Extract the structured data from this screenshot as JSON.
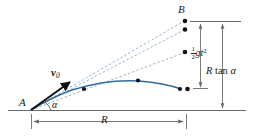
{
  "figure": {
    "type": "projectile-motion-diagram",
    "caption_labels": {
      "launch_point": "A",
      "target_point": "B",
      "initial_velocity": "v",
      "initial_velocity_subscript": "0",
      "launch_angle": "α",
      "range_label": "R",
      "drop_numerator": "1",
      "drop_denominator": "2",
      "drop_body": "gt",
      "drop_exponent": "2",
      "height_label_R": "R",
      "height_label_tan": "tan",
      "height_label_alpha": "α"
    },
    "colors": {
      "trajectory": "#2f6d9e",
      "dashed_line": "#8fa9bd",
      "axis": "#6b6b6b",
      "ink": "#1a1a1a",
      "background": "#ffffff"
    },
    "geometry": {
      "origin_A": [
        31,
        110
      ],
      "point_B": [
        185,
        21
      ],
      "ground_y": 110,
      "ground_x_start": 8,
      "ground_x_end": 246,
      "range_dim_y": 121,
      "range_x_start": 31,
      "range_x_end": 186,
      "inner_dim_x": 200,
      "outer_dim_x": 222,
      "inner_dim_top": 22,
      "inner_dim_bottom": 88,
      "outer_dim_top": 22,
      "outer_dim_bottom": 110,
      "tick_top_y": 21,
      "tick_top_x_start": 190,
      "tick_top_x_end": 241
    },
    "markers": {
      "trajectory_dots": [
        [
          84,
          89
        ],
        [
          138,
          81
        ],
        [
          179,
          89
        ]
      ],
      "dashed_endpoint_dots": [
        [
          185,
          21
        ],
        [
          185,
          29
        ],
        [
          185,
          52
        ],
        [
          187,
          89
        ]
      ]
    },
    "dashed_rays": [
      {
        "from": [
          31,
          110
        ],
        "to": [
          187,
          20
        ]
      },
      {
        "from": [
          31,
          110
        ],
        "to": [
          187,
          29
        ]
      },
      {
        "from": [
          31,
          110
        ],
        "to": [
          187,
          52
        ]
      }
    ],
    "trajectory_path": "M 31 110 Q 52 97 72 90 Q 108 80 138 81 Q 164 83 180 89",
    "velocity_arrow": {
      "from": [
        31,
        110
      ],
      "to": [
        72,
        81
      ]
    }
  }
}
